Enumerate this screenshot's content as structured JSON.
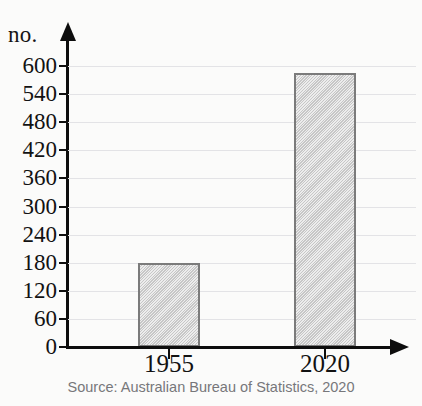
{
  "chart_data": {
    "type": "bar",
    "title": "",
    "subtitle": "",
    "xlabel": "",
    "ylabel": "no.",
    "categories": [
      "1955",
      "2020"
    ],
    "values": [
      180,
      585
    ],
    "ylim": [
      0,
      600
    ],
    "ytick_step": 60,
    "yticks": [
      "0",
      "60",
      "120",
      "180",
      "240",
      "300",
      "360",
      "420",
      "480",
      "540",
      "600"
    ],
    "grid": true,
    "legend": false,
    "series": [
      {
        "name": "no.",
        "values": [
          180,
          585
        ]
      }
    ],
    "annotations": [
      "Source: Australian Bureau of Statistics, 2020"
    ]
  },
  "axes": {
    "y_unit_label": "no.",
    "y_axis_name": "y-axis",
    "x_axis_name": "x-axis"
  },
  "source": {
    "text": "Source: Australian Bureau of Statistics, 2020"
  },
  "colors": {
    "bar_fill": "#d6d6d6",
    "bar_border": "#7b7b7b",
    "axis": "#0d0d0d",
    "gridline": "#e3e3e6",
    "tick_text": "#121212",
    "source_text": "#77777a",
    "background": "#fbfbfa"
  }
}
